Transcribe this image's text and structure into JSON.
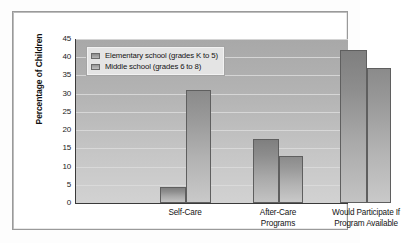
{
  "chart_data": {
    "type": "bar",
    "title": "",
    "xlabel": "",
    "ylabel": "Percentage of Children",
    "categories": [
      "Self-Care",
      "After-Care Programs",
      "Would Participate If Program Available"
    ],
    "category_lines": [
      [
        "Self-Care"
      ],
      [
        "After-Care",
        "Programs"
      ],
      [
        "Would Participate If",
        "Program Available"
      ]
    ],
    "series": [
      {
        "name": "Elementary school (grades K to 5)",
        "values": [
          4.5,
          17.5,
          42
        ]
      },
      {
        "name": "Middle school (grades 6 to 8)",
        "values": [
          31,
          12.8,
          37
        ]
      }
    ],
    "ylim": [
      0,
      45
    ],
    "yticks": [
      0,
      5,
      10,
      15,
      20,
      25,
      30,
      35,
      40,
      45
    ],
    "ytick_labels": [
      "0",
      "5",
      "10",
      "15",
      "20",
      "25",
      "30",
      "35",
      "40",
      "45"
    ],
    "grid": true,
    "legend_position": "upper left",
    "colors": {
      "elementary": "#8d8d8d",
      "middle": "#999999",
      "plot_background": "#b4b4b4",
      "gridline": "#dcdcdc",
      "axis": "#3a3a3a",
      "frame": "#9a9a9a",
      "text": "#141414"
    }
  },
  "legend": {
    "items": [
      {
        "label": "Elementary school (grades K to 5)",
        "swatch": "elementary"
      },
      {
        "label": "Middle school (grades 6 to 8)",
        "swatch": "middle"
      }
    ]
  }
}
